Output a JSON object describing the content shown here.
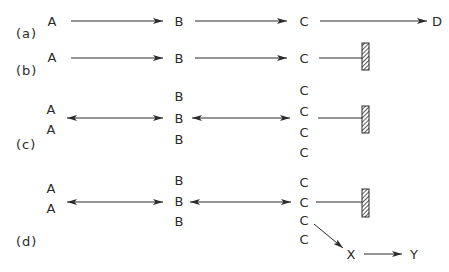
{
  "panels": {
    "a": {
      "label": "(a)",
      "nodes": {
        "A": "A",
        "B": "B",
        "C": "C",
        "D": "D"
      },
      "edges": [
        "A→B",
        "B→C",
        "C→D"
      ]
    },
    "b": {
      "label": "(b)",
      "nodes": {
        "A": "A",
        "B": "B",
        "C": "C"
      },
      "edges": [
        "A→B",
        "B→C",
        "C—barrier"
      ],
      "terminal": "barrier"
    },
    "c": {
      "label": "(c)",
      "nodes": {
        "A": [
          "A",
          "A"
        ],
        "B": [
          "B",
          "B",
          "B"
        ],
        "C": [
          "C",
          "C",
          "C",
          "C"
        ]
      },
      "edges": [
        "A↔B",
        "B↔C",
        "C—barrier"
      ],
      "terminal": "barrier"
    },
    "d": {
      "label": "(d)",
      "nodes": {
        "A": [
          "A",
          "A"
        ],
        "B": [
          "B",
          "B",
          "B"
        ],
        "C": [
          "C",
          "C",
          "C",
          "C"
        ],
        "X": "X",
        "Y": "Y"
      },
      "edges": [
        "A↔B",
        "B↔C",
        "C—barrier",
        "C→X",
        "X→Y"
      ],
      "terminal": "barrier"
    }
  },
  "colors": {
    "ink": "#2a2a2a",
    "barrier_fill": "#555555",
    "background": "#ffffff"
  }
}
